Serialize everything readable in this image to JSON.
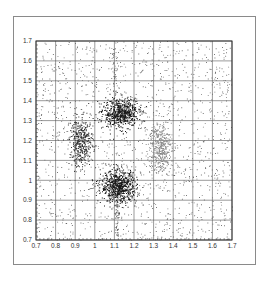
{
  "chart_data": {
    "type": "scatter",
    "title": "",
    "xlabel": "",
    "ylabel": "",
    "xlim": [
      0.7,
      1.7
    ],
    "ylim": [
      0.7,
      1.7
    ],
    "grid": true,
    "legend": null,
    "x_ticks": [
      "0.7",
      "0.8",
      "0.9",
      "1",
      "1.1",
      "1.2",
      "1.3",
      "1.4",
      "1.5",
      "1.6",
      "1.7"
    ],
    "y_ticks": [
      "0.7",
      "0.8",
      "0.9",
      "1",
      "1.1",
      "1.2",
      "1.3",
      "1.4",
      "1.5",
      "1.6",
      "1.7"
    ],
    "background_points": 1400,
    "clusters": [
      {
        "name": "top",
        "cx": 1.13,
        "cy": 1.34,
        "sx": 0.045,
        "sy": 0.035,
        "n": 650,
        "color": "#1a1a1a"
      },
      {
        "name": "bottom",
        "cx": 1.12,
        "cy": 0.97,
        "sx": 0.045,
        "sy": 0.04,
        "n": 750,
        "color": "#1a1a1a"
      },
      {
        "name": "left",
        "cx": 0.93,
        "cy": 1.19,
        "sx": 0.03,
        "sy": 0.06,
        "n": 420,
        "color": "#333333"
      },
      {
        "name": "right",
        "cx": 1.33,
        "cy": 1.17,
        "sx": 0.03,
        "sy": 0.07,
        "n": 420,
        "color": "#8a8a8a"
      }
    ],
    "streaks": [
      {
        "x": 1.1,
        "y_from": 1.4,
        "y_to": 1.7,
        "n": 60
      },
      {
        "x": 1.11,
        "y_from": 0.72,
        "y_to": 0.92,
        "n": 70
      }
    ]
  },
  "colors": {
    "grid": "#555555",
    "axis": "#333333",
    "frame": "#8a8a8a",
    "point": "#222222"
  }
}
